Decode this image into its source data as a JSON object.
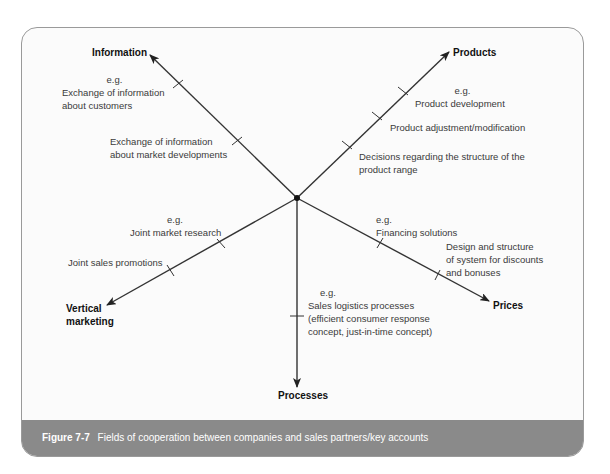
{
  "figure": {
    "number_label": "Figure 7-7",
    "caption": "Fields of cooperation between companies and sales partners/key accounts"
  },
  "axes": {
    "information": "Information",
    "products": "Products",
    "prices": "Prices",
    "processes": "Processes",
    "vertical_marketing_line1": "Vertical",
    "vertical_marketing_line2": "marketing"
  },
  "labels": {
    "info_eg": "e.g.",
    "info_1_line1": "Exchange of information",
    "info_1_line2": "about customers",
    "info_2_line1": "Exchange of information",
    "info_2_line2": "about market developments",
    "prod_eg": "e.g.",
    "prod_1": "Product development",
    "prod_2": "Product adjustment/modification",
    "prod_3_line1": "Decisions regarding the structure of the",
    "prod_3_line2": "product range",
    "price_eg": "e.g.",
    "price_1": "Financing solutions",
    "price_2_line1": "Design and structure",
    "price_2_line2": "of system for discounts",
    "price_2_line3": "and bonuses",
    "proc_eg": "e.g.",
    "proc_1_line1": "Sales logistics processes",
    "proc_1_line2": "(efficient consumer response",
    "proc_1_line3": "concept, just-in-time concept)",
    "vm_eg": "e.g.",
    "vm_1": "Joint market research",
    "vm_2": "Joint sales promotions"
  },
  "colors": {
    "frame_border": "#9a9a9a",
    "caption_bg": "#8a8a8a",
    "line": "#333333"
  }
}
